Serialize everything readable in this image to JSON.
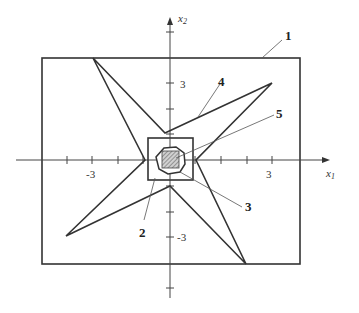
{
  "figure": {
    "axes": {
      "x_label": "x",
      "x_sub": "1",
      "y_label": "x",
      "y_sub": "2",
      "tick_labels": {
        "x_neg": "-3",
        "x_pos": "3",
        "y_pos": "3",
        "y_neg": "-3"
      }
    },
    "callouts": [
      {
        "id": "1",
        "label": "1"
      },
      {
        "id": "2",
        "label": "2"
      },
      {
        "id": "3",
        "label": "3"
      },
      {
        "id": "4",
        "label": "4"
      },
      {
        "id": "5",
        "label": "5"
      }
    ],
    "colors": {
      "line": "#333333",
      "hatch": "#666666"
    }
  }
}
